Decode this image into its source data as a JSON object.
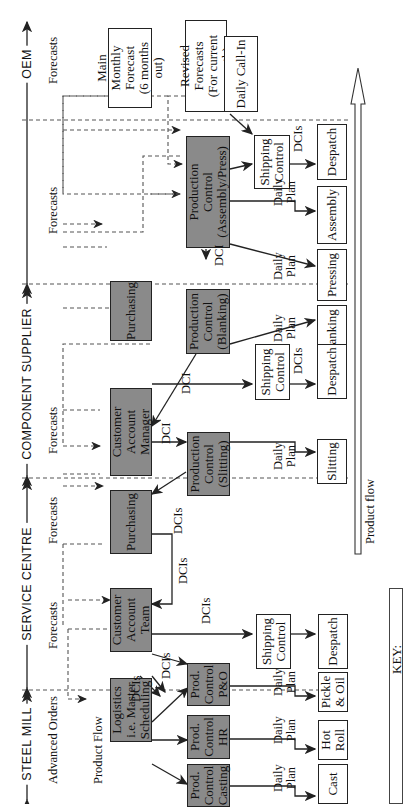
{
  "sections": [
    {
      "label": "OEM"
    },
    {
      "label": "COMPONENT SUPPLIER"
    },
    {
      "label": "SERVICE CENTRE"
    },
    {
      "label": "STEEL MILL"
    }
  ],
  "oem": {
    "main_monthly_forecast": "Main Monthly\nForecast\n(6 months out)",
    "revised_forecasts": "Revised Forecasts\n(For current month)",
    "daily_call_in": "Daily Call-In"
  },
  "component_supplier": {
    "production_control_assembly_press": "Production\nControl\n(Assembly/Press)",
    "production_control_blanking": "Production\nControl\n(Blanking)",
    "purchasing": "Purchasing",
    "shipping_control": "Shipping\nControl",
    "despatch": "Despatch",
    "assembly": "Assembly",
    "pressing": "Pressing",
    "blanking": "Blanking"
  },
  "service_centre": {
    "customer_account_manager": "Customer Account\nManager",
    "production_control_slitting": "Production\nControl\n(Slitting)",
    "purchasing": "Purchasing",
    "shipping_control": "Shipping\nControl",
    "despatch": "Despatch",
    "slitting": "Slitting"
  },
  "steel_mill": {
    "customer_account_team": "Customer\nAccount\nTeam",
    "logistics": "Logistics\ni.e. Master\nScheduling",
    "prod_control_po": "Prod.\nControl\nP&O",
    "prod_control_hr": "Prod.\nControl\nHR",
    "prod_control_casting": "Prod.\nControl\nCasting",
    "shipping_control": "Shipping\nControl",
    "despatch": "Despatch",
    "pickle_oil": "Pickle\n& Oil",
    "hot_roll": "Hot\nRoll",
    "cast": "Cast"
  },
  "edge_labels": {
    "forecasts": "Forecasts",
    "advanced_orders": "Advanced Orders",
    "product_flow_small": "Product Flow",
    "dci": "DCI",
    "dcis": "DCIs",
    "daily_plan": "Daily\nPlan",
    "product_flow": "Product flow"
  },
  "key": {
    "label": "KEY:"
  },
  "colors": {
    "dark_box": "#8a8a8a",
    "line": "#222222"
  }
}
